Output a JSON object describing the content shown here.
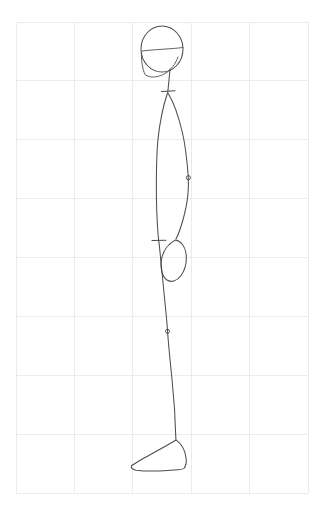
{
  "document": {
    "title": "Figure drawing — standing figure in profile",
    "medium": "pencil line drawing on graph paper",
    "background_color": "#ffffff",
    "ink_color": "#4d4d4d",
    "grid_color": "#ebebeb"
  },
  "grid": {
    "name": "graph-paper-grid",
    "left": 16,
    "top": 22,
    "right": 308,
    "bottom": 493,
    "columns": 5,
    "rows": 8,
    "cell_width": 58.4,
    "cell_height": 58.9,
    "vertical_line_x": [
      16,
      74.4,
      132.8,
      191.2,
      249.6,
      308
    ],
    "horizontal_line_y": [
      22,
      80.9,
      139.8,
      198.6,
      257.5,
      316.4,
      375.3,
      434.1,
      493
    ]
  },
  "figure": {
    "name": "standing-figure",
    "parts": [
      {
        "name": "head-circle",
        "type": "ellipse",
        "cx": 162,
        "cy": 49,
        "rx": 21,
        "ry": 23
      },
      {
        "name": "head-eyeline",
        "type": "path",
        "d": "M 142 51 C 152 49.6 172 49 183 47.5"
      },
      {
        "name": "jaw-line",
        "type": "path",
        "d": "M 141.5 52 C 141 60 142.5 69 145 74.5 C 150 78.5 158 77.5 165 73.5 C 171 70 175.5 64 178 57"
      },
      {
        "name": "neck-line",
        "type": "path",
        "d": "M 170 69 C 169.5 76 168.5 84 167.8 92.5"
      },
      {
        "name": "shoulder-tick",
        "type": "line",
        "x1": 161.5,
        "y1": 91.5,
        "x2": 175,
        "y2": 90.8
      },
      {
        "name": "torso-front-line",
        "type": "path",
        "d": "M 167.5 93 C 163.5 105 159.5 124 157.8 141 C 156.6 155 156.2 175 156.4 196 C 156.7 216 157.6 232 159 243.5"
      },
      {
        "name": "arm-line",
        "type": "path",
        "d": "M 168.2 93.5 C 173.5 102 178.5 116 182.5 133 C 185.8 147 187.2 163 188.2 175.8 C 189 188 187.5 203 184 216 C 181.5 226 178.5 234 176 239"
      },
      {
        "name": "elbow-joint-circle",
        "type": "circle",
        "cx": 188.4,
        "cy": 177.7,
        "r": 2.1
      },
      {
        "name": "hip-tick",
        "type": "line",
        "x1": 152,
        "y1": 240.5,
        "x2": 166,
        "y2": 240.2
      },
      {
        "name": "hand-outline",
        "type": "path",
        "d": "M 175.5 240 C 168.5 243.5 163 251 161.5 259.5 C 160 268 162 276 166.5 279.8 C 171 283 177 281 181 275.5 C 185 270 187 261.5 186 253.5 C 185.2 246.5 181 241 175.5 240 Z"
      },
      {
        "name": "leg-line",
        "type": "path",
        "d": "M 159.2 244 C 161 262 163.5 288 165.8 311 C 166.8 321 167.3 327 167.6 331.5 C 168.3 343 170 360 172 379 C 174 398 175.4 420 175.9 439.5"
      },
      {
        "name": "knee-joint-circle",
        "type": "circle",
        "cx": 167.5,
        "cy": 331.3,
        "r": 2.0
      },
      {
        "name": "foot-top-line",
        "type": "path",
        "d": "M 176 440 C 168 445 155 452 145 457.5 C 138 461.5 134 464 131.5 465.8"
      },
      {
        "name": "foot-heel-line",
        "type": "path",
        "d": "M 176.3 440.2 C 181.5 444 185 450.5 186 457.5 C 186.6 462 186 465.5 184.5 467.5"
      },
      {
        "name": "foot-sole-line",
        "type": "path",
        "d": "M 131.3 466 C 131 468 132.5 469.5 136 470.2 C 146 471.5 164 471 178 469.8 C 182 469.4 184.3 468.7 184.8 467.6"
      }
    ]
  }
}
